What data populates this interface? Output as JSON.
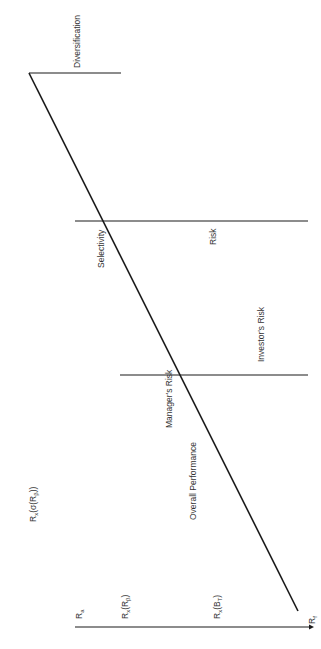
{
  "diagram": {
    "type": "performance-attribution",
    "orientation": "rotated-90-ccw",
    "colors": {
      "line": "#1a1a1a",
      "text": "#333333",
      "background": "#ffffff"
    },
    "labels": {
      "diversification": "Diversification",
      "selectivity": "Selectivity",
      "risk": "Risk",
      "investors_risk": "Investor's Risk",
      "managers_risk": "Manager's Risk",
      "overall_performance": "Overall Performance"
    },
    "axis_labels": {
      "rx_sigma_main": "R",
      "rx_sigma_sub": "x",
      "rx_sigma_rest": "(σ(R",
      "rx_sigma_sub2": "β",
      "rx_sigma_end": "))",
      "ra_main": "R",
      "ra_sub": "a",
      "rx_rb_main": "R",
      "rx_rb_sub": "x",
      "rx_rb_rest": "(R",
      "rx_rb_sub2": "β",
      "rx_rb_end": ")",
      "rx_bt_main": "R",
      "rx_bt_sub": "x",
      "rx_bt_rest": "(B",
      "rx_bt_sub2": "T",
      "rx_bt_end": ")",
      "rf_main": "R",
      "rf_sub": "f"
    }
  }
}
